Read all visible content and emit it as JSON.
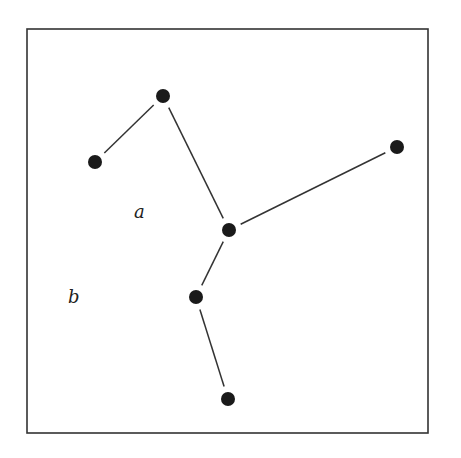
{
  "diagram": {
    "type": "tree-graph-in-frame",
    "frame": {
      "x": 27,
      "y": 29,
      "width": 401,
      "height": 404,
      "stroke": "#333333"
    },
    "colors": {
      "node": "#1a1a1a",
      "edge": "#333333",
      "background": "#ffffff"
    },
    "nodes": [
      {
        "id": "n_top",
        "x": 163,
        "y": 96
      },
      {
        "id": "n_left",
        "x": 95,
        "y": 162
      },
      {
        "id": "n_center",
        "x": 229,
        "y": 230
      },
      {
        "id": "n_right",
        "x": 397,
        "y": 147
      },
      {
        "id": "n_lower",
        "x": 196,
        "y": 297
      },
      {
        "id": "n_bottom",
        "x": 228,
        "y": 399
      }
    ],
    "edges": [
      {
        "from": "n_left",
        "to": "n_top"
      },
      {
        "from": "n_top",
        "to": "n_center"
      },
      {
        "from": "n_center",
        "to": "n_right"
      },
      {
        "from": "n_center",
        "to": "n_lower"
      },
      {
        "from": "n_lower",
        "to": "n_bottom"
      }
    ],
    "labels": [
      {
        "id": "label_a",
        "text": "a",
        "x": 134,
        "y": 218
      },
      {
        "id": "label_b",
        "text": "b",
        "x": 68,
        "y": 303
      }
    ]
  }
}
